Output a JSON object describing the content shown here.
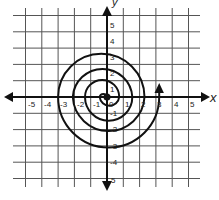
{
  "figure": {
    "type": "coordinate-plane-spiral",
    "axes": {
      "x_label": "x",
      "y_label": "y",
      "x_ticks": [
        "-5",
        "-4",
        "-3",
        "-2",
        "-1",
        "0",
        "1",
        "2",
        "3",
        "4",
        "5"
      ],
      "y_ticks": [
        "5",
        "4",
        "3",
        "2",
        "1",
        "-1",
        "-2",
        "-3",
        "-4",
        "5"
      ],
      "x_range": [
        -5,
        5
      ],
      "y_range": [
        -5,
        5
      ]
    },
    "grid": {
      "on": true,
      "step": 1
    },
    "spiral": {
      "description": "Spiral of alternating semicircles starting at the origin and ending with an upward arrow near x = 3",
      "x_axis_crossings_left": [
        -0.45,
        -1.35,
        -2.1,
        -3.0
      ],
      "x_axis_crossings_right": [
        0.75,
        1.55,
        2.3,
        3.2
      ],
      "start_point": [
        0,
        0
      ],
      "end_arrow_at": [
        3.2,
        0
      ],
      "end_arrow_direction": "up"
    },
    "colors": {
      "line": "#111111",
      "grid": "#555555",
      "background": "#ffffff"
    }
  }
}
